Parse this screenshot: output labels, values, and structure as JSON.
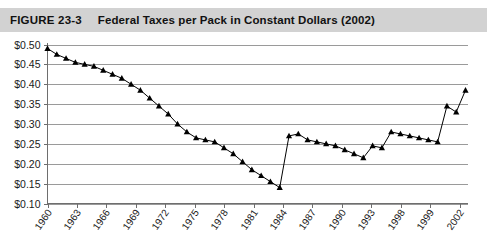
{
  "header": {
    "figure_number": "FIGURE 23-3",
    "title": "Federal Taxes per Pack in Constant Dollars (2002)",
    "band_color": "#d2d2d2"
  },
  "axes": {
    "y_tick_labels": [
      "$0.50",
      "$0.45",
      "$0.40",
      "$0.35",
      "$0.30",
      "$0.25",
      "$0.20",
      "$0.15",
      "$0.10"
    ],
    "x_tick_labels": [
      "1960",
      "1963",
      "1966",
      "1969",
      "1972",
      "1975",
      "1978",
      "1981",
      "1984",
      "1987",
      "1990",
      "1993",
      "1998",
      "1999",
      "2002"
    ]
  },
  "chart_data": {
    "type": "line",
    "title": "Federal Taxes per Pack in Constant Dollars (2002)",
    "xlabel": "",
    "ylabel": "",
    "ylim": [
      0.1,
      0.5
    ],
    "xlim": [
      1960,
      2002
    ],
    "grid": true,
    "legend": false,
    "marker": "triangle-up",
    "line_color": "#000000",
    "y_ticks": [
      0.5,
      0.45,
      0.4,
      0.35,
      0.3,
      0.25,
      0.2,
      0.15,
      0.1
    ],
    "y_tick_labels": [
      "$0.50",
      "$0.45",
      "$0.40",
      "$0.35",
      "$0.30",
      "$0.25",
      "$0.20",
      "$0.15",
      "$0.10"
    ],
    "x_ticks": [
      1960,
      1963,
      1966,
      1969,
      1972,
      1975,
      1978,
      1981,
      1984,
      1987,
      1990,
      1993,
      1998,
      1999,
      2002
    ],
    "x_tick_labels": [
      "1960",
      "1963",
      "1966",
      "1969",
      "1972",
      "1975",
      "1978",
      "1981",
      "1984",
      "1987",
      "1990",
      "1993",
      "1998",
      "1999",
      "2002"
    ],
    "x": [
      1960,
      1961,
      1962,
      1963,
      1964,
      1965,
      1966,
      1967,
      1968,
      1969,
      1970,
      1971,
      1972,
      1973,
      1974,
      1975,
      1976,
      1977,
      1978,
      1979,
      1980,
      1981,
      1982,
      1983,
      1984,
      1985,
      1986,
      1987,
      1988,
      1989,
      1990,
      1991,
      1992,
      1993,
      1994,
      1995,
      1996,
      1997,
      1998,
      1999,
      2000,
      2001,
      2002
    ],
    "values": [
      0.49,
      0.475,
      0.465,
      0.455,
      0.45,
      0.445,
      0.435,
      0.425,
      0.415,
      0.4,
      0.385,
      0.365,
      0.345,
      0.325,
      0.3,
      0.28,
      0.265,
      0.26,
      0.255,
      0.24,
      0.225,
      0.205,
      0.185,
      0.17,
      0.155,
      0.14,
      0.27,
      0.275,
      0.26,
      0.255,
      0.25,
      0.245,
      0.235,
      0.225,
      0.215,
      0.245,
      0.24,
      0.28,
      0.275,
      0.27,
      0.265,
      0.26,
      0.255
    ],
    "series": [
      {
        "name": "Federal tax per pack (constant 2002 dollars)",
        "values": [
          0.49,
          0.475,
          0.465,
          0.455,
          0.45,
          0.445,
          0.435,
          0.425,
          0.415,
          0.4,
          0.385,
          0.365,
          0.345,
          0.325,
          0.3,
          0.28,
          0.265,
          0.26,
          0.255,
          0.24,
          0.225,
          0.205,
          0.185,
          0.17,
          0.155,
          0.14,
          0.27,
          0.275,
          0.26,
          0.255,
          0.25,
          0.245,
          0.235,
          0.225,
          0.215,
          0.245,
          0.24,
          0.28,
          0.275,
          0.27,
          0.265,
          0.26,
          0.255
        ]
      }
    ],
    "annotations": [
      {
        "label": "peak",
        "x": 1960,
        "y": 0.49
      },
      {
        "label": "trough",
        "x": 1985,
        "y": 0.14
      },
      {
        "label": "1983 tax increase jump",
        "x": 1986,
        "y": 0.27
      },
      {
        "label": "2000 tax increase jump",
        "x": 2000,
        "y": 0.345
      },
      {
        "label": "final value",
        "x": 2002,
        "y": 0.385
      }
    ]
  },
  "chart_extra_points": {
    "tail_x": [
      2000,
      2001,
      2002
    ],
    "tail_values": [
      0.345,
      0.33,
      0.385
    ]
  }
}
